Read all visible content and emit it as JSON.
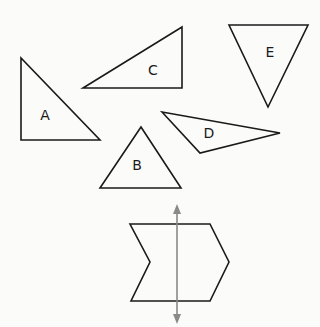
{
  "diagram": {
    "shapes": [
      {
        "id": "A",
        "label": "A",
        "points": "21,58 21,140 100,140",
        "label_x": 45,
        "label_y": 116
      },
      {
        "id": "B",
        "label": "B",
        "points": "141,127 100,188 181,188",
        "label_x": 137,
        "label_y": 166
      },
      {
        "id": "C",
        "label": "C",
        "points": "83,88 182,27 182,88",
        "label_x": 153,
        "label_y": 71
      },
      {
        "id": "D",
        "label": "D",
        "points": "162,112 280,133 200,153",
        "label_x": 209,
        "label_y": 134
      },
      {
        "id": "E",
        "label": "E",
        "points": "229,25 308,25 268,107",
        "label_x": 270,
        "label_y": 53
      }
    ],
    "chevron": {
      "points": "130,224 210,224 229,262 210,301 131,301 150,262"
    },
    "symmetry_line": {
      "x": 177,
      "y1": 211,
      "y2": 318,
      "arrow_top": "177,204 173,214 181,214",
      "arrow_bottom": "177,324 173,314 181,314"
    },
    "colors": {
      "stroke": "#1a1a1a",
      "axis": "#8a8a8a",
      "background": "#fbfbf9"
    }
  }
}
